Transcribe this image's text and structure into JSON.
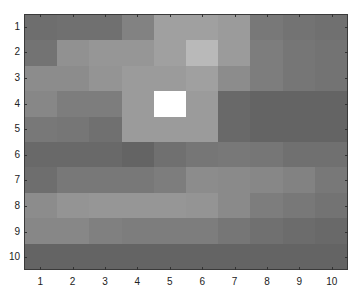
{
  "chart_data": {
    "type": "heatmap",
    "title": "",
    "xlabel": "",
    "ylabel": "",
    "colormap": "gray",
    "x_ticks": [
      "1",
      "2",
      "3",
      "4",
      "5",
      "6",
      "7",
      "8",
      "9",
      "10"
    ],
    "y_ticks": [
      "1",
      "2",
      "3",
      "4",
      "5",
      "6",
      "7",
      "8",
      "9",
      "10"
    ],
    "values": [
      [
        110,
        112,
        112,
        130,
        160,
        160,
        155,
        120,
        115,
        112
      ],
      [
        115,
        145,
        150,
        150,
        160,
        185,
        155,
        125,
        118,
        115
      ],
      [
        140,
        140,
        148,
        155,
        155,
        160,
        140,
        125,
        118,
        115
      ],
      [
        135,
        125,
        125,
        155,
        255,
        155,
        105,
        100,
        100,
        100
      ],
      [
        120,
        118,
        112,
        155,
        155,
        155,
        105,
        100,
        100,
        100
      ],
      [
        105,
        105,
        105,
        100,
        112,
        118,
        120,
        118,
        112,
        112
      ],
      [
        110,
        120,
        120,
        120,
        125,
        140,
        138,
        135,
        130,
        120
      ],
      [
        140,
        148,
        150,
        150,
        150,
        148,
        138,
        125,
        120,
        115
      ],
      [
        135,
        135,
        128,
        125,
        125,
        125,
        118,
        112,
        108,
        105
      ],
      [
        100,
        100,
        100,
        100,
        100,
        100,
        100,
        100,
        100,
        100
      ]
    ],
    "highlight": {
      "row": 4,
      "col": 5,
      "color": "#ffffff"
    }
  }
}
